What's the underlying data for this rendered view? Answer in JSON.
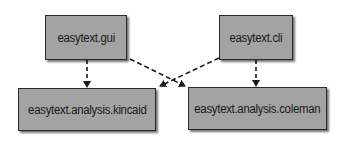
{
  "diagram": {
    "type": "module-dependency",
    "nodes": [
      {
        "id": "gui",
        "label": "easytext.gui"
      },
      {
        "id": "cli",
        "label": "easytext.cli"
      },
      {
        "id": "kincaid",
        "label": "easytext.analysis.kincaid"
      },
      {
        "id": "coleman",
        "label": "easytext.analysis.coleman"
      }
    ],
    "edges": [
      {
        "from": "gui",
        "to": "kincaid",
        "style": "dashed"
      },
      {
        "from": "gui",
        "to": "coleman",
        "style": "dashed"
      },
      {
        "from": "cli",
        "to": "kincaid",
        "style": "dashed"
      },
      {
        "from": "cli",
        "to": "coleman",
        "style": "dashed"
      }
    ],
    "colors": {
      "node_fill": "#a3a3a3",
      "node_border": "#2a2a2a",
      "edge": "#1a1a1a",
      "background": "#ffffff"
    }
  }
}
